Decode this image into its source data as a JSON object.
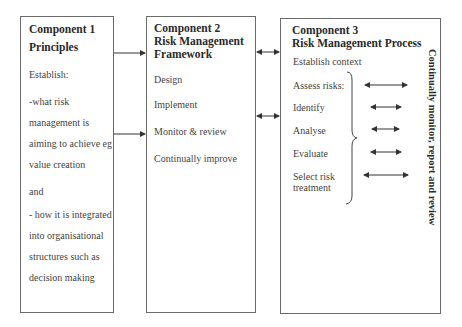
{
  "components": [
    {
      "title_line1": "Component 1",
      "title_line2": "Principles",
      "lines": [
        "Establish:",
        "-what risk",
        "management is",
        "aiming to achieve eg",
        "value creation",
        "and",
        "- how it is integrated",
        "into organisational",
        "structures such as",
        "decision making"
      ]
    },
    {
      "title_line1": "Component 2",
      "title_line2": "Risk Management",
      "title_line3": "Framework",
      "items": [
        "Design",
        "Implement",
        "Monitor & review",
        "Continually improve"
      ]
    },
    {
      "title_line1": "Component 3",
      "title_line2": "Risk Management Process",
      "establish": "Establish context",
      "assess": "Assess risks:",
      "steps": [
        "Identify",
        "Analyse",
        "Evaluate",
        "Select risk",
        "treatment"
      ],
      "side_label": "Continually monitor, report and review"
    }
  ],
  "colors": {
    "border": "#6a6a6a",
    "arrow": "#333333",
    "text": "#444444"
  }
}
